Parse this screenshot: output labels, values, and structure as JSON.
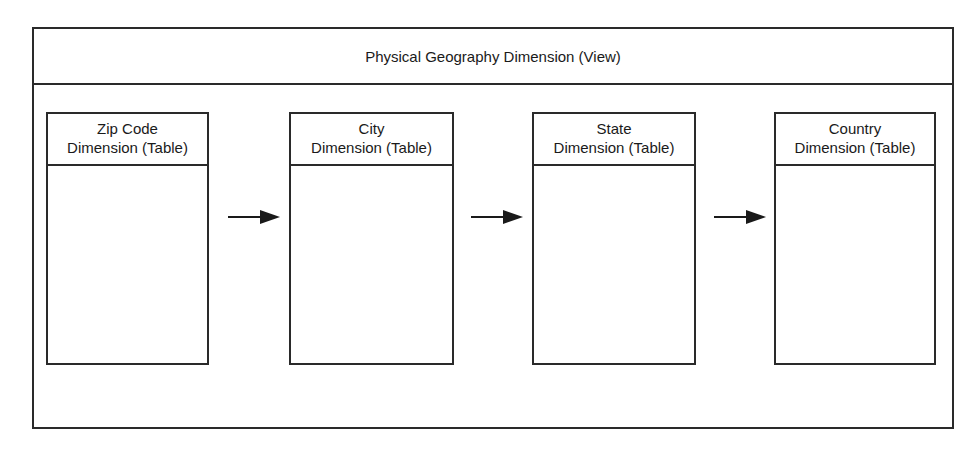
{
  "view": {
    "title": "Physical Geography Dimension (View)"
  },
  "tables": [
    {
      "line1": "Zip Code",
      "line2": "Dimension (Table)"
    },
    {
      "line1": "City",
      "line2": "Dimension (Table)"
    },
    {
      "line1": "State",
      "line2": "Dimension (Table)"
    },
    {
      "line1": "Country",
      "line2": "Dimension (Table)"
    }
  ],
  "colors": {
    "stroke": "#2a2a2a",
    "background": "#ffffff"
  }
}
